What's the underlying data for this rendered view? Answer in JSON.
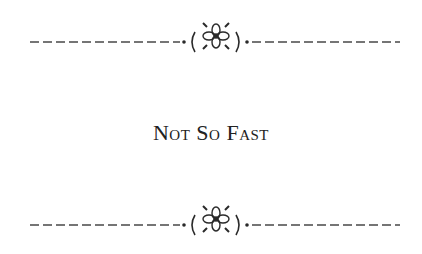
{
  "heading": {
    "title": "Not So Fast"
  },
  "ornaments": {
    "top": "floral-divider",
    "bottom": "floral-divider"
  },
  "colors": {
    "ink": "#2a2a2a",
    "background": "#ffffff"
  }
}
